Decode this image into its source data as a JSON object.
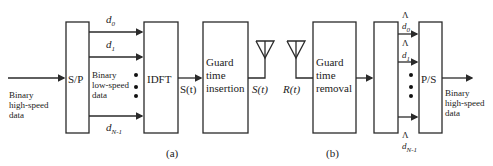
{
  "diagram": {
    "transmitter": {
      "input_label": [
        "Binary",
        "high-speed",
        "data"
      ],
      "sp_label": "S/P",
      "subchannel_labels": [
        "d",
        "d",
        "d"
      ],
      "subchannel_subs": [
        "0",
        "1",
        "N-1"
      ],
      "lowspeed_label": [
        "Binary",
        "low-speed",
        "data"
      ],
      "idft_label": "IDFT",
      "st_label": "S(t)",
      "guard_insert_label": [
        "Guard",
        "time",
        "insertion"
      ],
      "tx_signal": "S(t)",
      "caption": "(a)"
    },
    "receiver": {
      "rx_signal": "R(t)",
      "guard_remove_label": [
        "Guard",
        "time",
        "removal"
      ],
      "hat_symbol": "Λ",
      "subchannel_labels": [
        "d",
        "d",
        "d"
      ],
      "subchannel_subs": [
        "0",
        "1",
        "N-1"
      ],
      "ps_label": "P/S",
      "output_label": [
        "Binary",
        "high-speed",
        "data"
      ],
      "caption": "(b)"
    },
    "colors": {
      "line": "#2a2a2a",
      "background": "#ffffff"
    }
  }
}
